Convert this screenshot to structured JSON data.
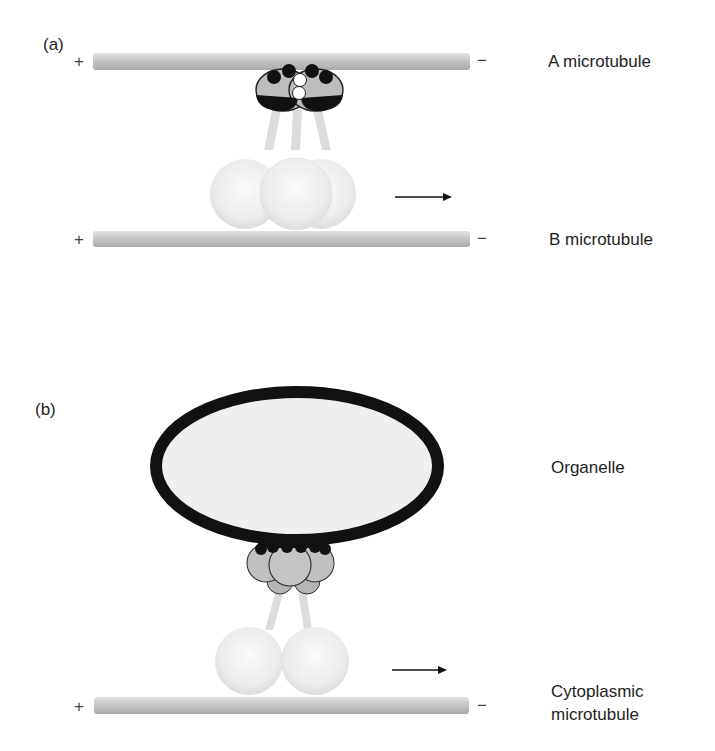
{
  "panels": [
    {
      "id": "a",
      "label": "(a)",
      "top_track": {
        "label": "A microtubule",
        "plus": "+",
        "minus": "−"
      },
      "bottom_track": {
        "label": "B microtubule",
        "plus": "+",
        "minus": "−"
      },
      "motor": "axonemal dynein (three heads, outer arm)",
      "arrow": "movement toward minus end"
    },
    {
      "id": "b",
      "label": "(b)",
      "cargo": {
        "label": "Organelle"
      },
      "bottom_track": {
        "label_line1": "Cytoplasmic",
        "label_line2": "microtubule",
        "plus": "+",
        "minus": "−"
      },
      "motor": "cytoplasmic dynein (two heads)",
      "arrow": "movement toward minus end"
    }
  ],
  "colors": {
    "microtubule": "#c9c9c9",
    "microtubule_shade": "#a8a8a8",
    "head_fill": "#ececec",
    "stalk": "#dcdcdc",
    "light_chain_fill": "#b9b9b9",
    "black": "#111111",
    "organelle_fill": "#efefef"
  }
}
